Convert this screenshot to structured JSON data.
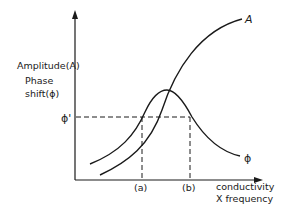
{
  "diagram": {
    "y_axis_label_line1": "Amplitude(A)",
    "y_axis_label_line2": "Phase",
    "y_axis_label_line3": "shift(ϕ)",
    "x_axis_label_line1": "conductivity",
    "x_axis_label_line2": "X frequency",
    "phi_prime_label": "ϕ'",
    "marker_a_label": "(a)",
    "marker_b_label": "(b)",
    "curve_amplitude_label": "A",
    "curve_phase_label": "ϕ",
    "colors": {
      "line": "#1a1a1a",
      "background": "#ffffff"
    }
  }
}
